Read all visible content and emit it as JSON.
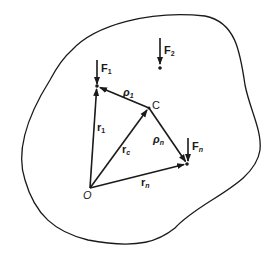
{
  "diagram": {
    "colors": {
      "ink": "#1a1a1a",
      "background": "#ffffff"
    },
    "labels": {
      "F1": {
        "main": "F",
        "sub": "1"
      },
      "F2": {
        "main": "F",
        "sub": "2"
      },
      "Fn": {
        "main": "F",
        "sub": "n"
      },
      "rho1": {
        "main": "ρ",
        "sub": "1"
      },
      "rhon": {
        "main": "ρ",
        "sub": "n"
      },
      "r1": {
        "main": "r",
        "sub": "1"
      },
      "rc": {
        "main": "r",
        "sub": "c"
      },
      "rn": {
        "main": "r",
        "sub": "n"
      },
      "C": "C",
      "O": "O"
    },
    "points": {
      "O": [
        90,
        188
      ],
      "P1": [
        97,
        86
      ],
      "C": [
        149,
        108
      ],
      "Pn": [
        187,
        164
      ],
      "P2": [
        160,
        68
      ]
    }
  }
}
